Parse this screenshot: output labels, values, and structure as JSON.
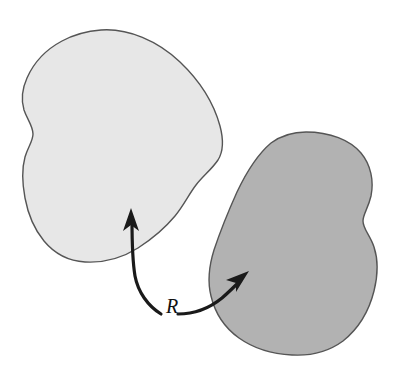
{
  "diagram": {
    "kind": "relation-between-two-sets",
    "background_color": "#ffffff",
    "label": {
      "text": "R",
      "style": "italic-serif",
      "color": "#111111",
      "x": 166,
      "y": 313
    },
    "shapes": [
      {
        "id": "domain-blob",
        "name": "light-blob",
        "role": "source-set",
        "fill_color": "#e7e7e7",
        "stroke_color": "#555555",
        "stroke_width": 1.4,
        "approx_bounds": {
          "x": 22,
          "y": 29,
          "width": 201,
          "height": 234
        },
        "path": "M 101 30 C 128 28 158 41 180 62 C 200 81 214 104 220 126 C 224 141 223 152 218 160 C 212 169 203 176 196 185 C 189 194 184 205 175 216 C 165 228 152 239 138 248 C 122 258 103 263 85 262 C 68 261 54 253 44 241 C 34 229 28 214 25 198 C 22 182 22 168 25 157 C 28 147 33 141 33 134 C 33 126 27 119 24 110 C 21 100 22 89 27 78 C 34 62 47 49 62 41 C 75 34 88 31 101 30 Z"
      },
      {
        "id": "codomain-blob",
        "name": "dark-blob",
        "role": "target-set",
        "fill_color": "#b2b2b2",
        "stroke_color": "#555555",
        "stroke_width": 1.4,
        "approx_bounds": {
          "x": 209,
          "y": 131,
          "width": 167,
          "height": 224
        },
        "path": "M 306 132 C 330 132 350 140 361 153 C 371 165 374 181 371 196 C 368 209 363 214 363 221 C 363 229 370 235 374 247 C 378 259 378 275 374 291 C 369 311 358 329 343 341 C 328 352 310 356 292 355 C 272 354 253 348 239 338 C 225 328 215 313 211 296 C 207 280 209 266 214 250 C 220 232 228 212 237 192 C 247 171 258 154 271 143 C 282 135 294 132 306 132 Z"
      }
    ],
    "arrows": [
      {
        "id": "arrow-to-light-blob",
        "name": "arrow-left",
        "from_label": "R",
        "to_shape": "domain-blob",
        "color": "#1a1a1a",
        "path": "M 161 314 C 148 306 138 292 135 276 C 132 258 132 238 132 220",
        "tip": {
          "x": 131,
          "y": 210
        },
        "direction": "up"
      },
      {
        "id": "arrow-to-dark-blob",
        "name": "arrow-right",
        "from_label": "R",
        "to_shape": "codomain-blob",
        "color": "#1a1a1a",
        "path": "M 178 314 C 195 314 211 307 222 298 C 230 291 236 285 241 280",
        "tip": {
          "x": 247,
          "y": 274
        },
        "direction": "up-right"
      }
    ]
  }
}
